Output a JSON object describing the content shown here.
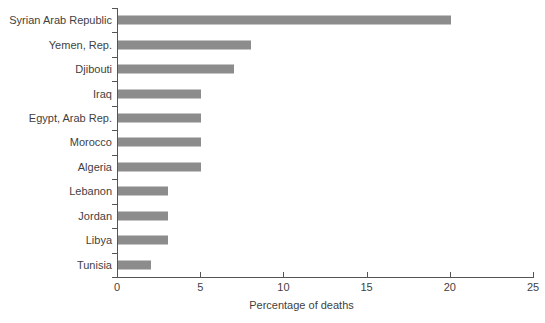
{
  "chart_data": {
    "type": "bar",
    "orientation": "horizontal",
    "title": "",
    "xlabel": "Percentage of deaths",
    "ylabel": "",
    "xlim": [
      0,
      25
    ],
    "xticks": [
      0,
      5,
      10,
      15,
      20,
      25
    ],
    "grid": false,
    "legend": false,
    "bar_color": "#8c8c8c",
    "axis_color": "#555555",
    "text_color": "#3f3f3f",
    "background": "#ffffff",
    "categories": [
      "Syrian Arab Republic",
      "Yemen, Rep.",
      "Djibouti",
      "Iraq",
      "Egypt, Arab Rep.",
      "Morocco",
      "Algeria",
      "Lebanon",
      "Jordan",
      "Libya",
      "Tunisia"
    ],
    "values": [
      20,
      8,
      7,
      5,
      5,
      5,
      5,
      3,
      3,
      3,
      2
    ]
  }
}
